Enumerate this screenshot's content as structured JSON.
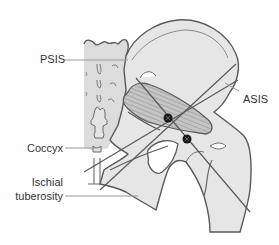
{
  "diagram": {
    "labels": {
      "psis": "PSIS",
      "asis": "ASIS",
      "coccyx": "Coccyx",
      "ischial_line1": "Ischial",
      "ischial_line2": "tuberosity"
    },
    "colors": {
      "bone_fill": "#e6e6e6",
      "sacrum_fill": "#dcdcdc",
      "outline": "#5a5a5a",
      "muscle_fill": "#bdbdbd",
      "muscle_stripe": "#8a8a8a",
      "leader_line": "#9a9a9a",
      "marker": "#1a1a1a",
      "text": "#333333"
    },
    "markers": [
      {
        "name": "upper-landmark-point",
        "x": 168,
        "y": 118
      },
      {
        "name": "lower-landmark-point",
        "x": 187,
        "y": 139
      }
    ]
  }
}
